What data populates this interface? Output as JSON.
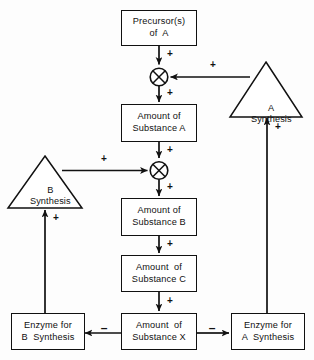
{
  "diagram": {
    "background_color": "#fdfdfd",
    "line_color": "#111111",
    "nodes": {
      "precursors": {
        "line1": "Precursor(s)",
        "line2": "of  A"
      },
      "amount_a": {
        "line1": "Amount of",
        "line2": "Substance A"
      },
      "amount_b": {
        "line1": "Amount of",
        "line2": "Substance B"
      },
      "amount_c": {
        "line1": "Amount  of",
        "line2": "Substance C"
      },
      "amount_x": {
        "line1": "Amount  of",
        "line2": "Substance X"
      },
      "enzyme_b": {
        "line1": "Enzyme for",
        "line2": "B  Synthesis"
      },
      "enzyme_a": {
        "line1": "Enzyme for",
        "line2": "A  Synthesis"
      },
      "a_synthesis": {
        "line1": "A",
        "line2": "Synthesis"
      },
      "b_synthesis": {
        "line1": "B",
        "line2": "Synthesis"
      }
    },
    "edge_signs": {
      "precursors_to_junction_a": "+",
      "a_synthesis_to_junction_a": "+",
      "junction_a_to_amount_a": "+",
      "amount_a_to_junction_b": "+",
      "b_synthesis_to_junction_b": "+",
      "junction_b_to_amount_b": "+",
      "amount_b_to_amount_c": "+",
      "amount_c_to_amount_x": "+",
      "amount_x_to_enzyme_b": "–",
      "amount_x_to_enzyme_a": "–",
      "enzyme_a_to_a_synthesis": "+",
      "enzyme_b_to_b_synthesis": "+"
    }
  }
}
